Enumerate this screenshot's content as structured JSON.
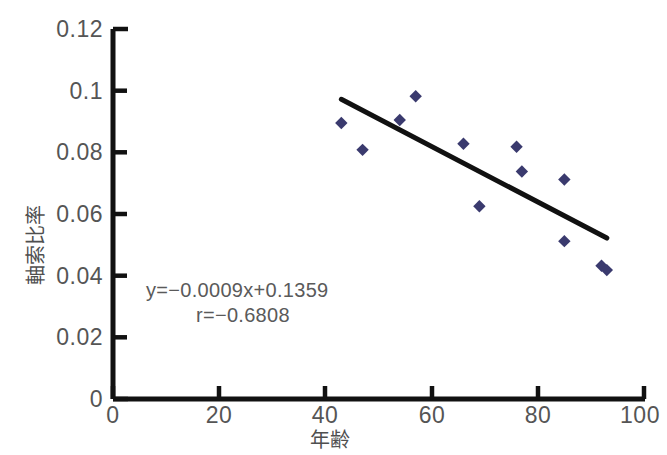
{
  "chart_data": {
    "type": "scatter",
    "title": "",
    "xlabel": "年齢",
    "ylabel": "軸索比率",
    "xlim": [
      0,
      100
    ],
    "ylim": [
      0,
      0.12
    ],
    "grid": false,
    "legend": null,
    "x_ticks": [
      "0",
      "20",
      "40",
      "60",
      "80",
      "100"
    ],
    "x_tick_values": [
      0,
      20,
      40,
      60,
      80,
      100
    ],
    "y_ticks": [
      "0",
      "0.02",
      "0.04",
      "0.06",
      "0.08",
      "0.1",
      "0.12"
    ],
    "y_tick_values": [
      0,
      0.02,
      0.04,
      0.06,
      0.08,
      0.1,
      0.12
    ],
    "marker": "diamond",
    "marker_color": "#3a3a6e",
    "points": [
      {
        "x": 43,
        "y": 0.0895
      },
      {
        "x": 47,
        "y": 0.0808
      },
      {
        "x": 54,
        "y": 0.0905
      },
      {
        "x": 57,
        "y": 0.0982
      },
      {
        "x": 66,
        "y": 0.0828
      },
      {
        "x": 69,
        "y": 0.0625
      },
      {
        "x": 76,
        "y": 0.0818
      },
      {
        "x": 77,
        "y": 0.0738
      },
      {
        "x": 85,
        "y": 0.0712
      },
      {
        "x": 85,
        "y": 0.0512
      },
      {
        "x": 92,
        "y": 0.0432
      },
      {
        "x": 93,
        "y": 0.0418
      }
    ],
    "trendline": {
      "color": "#111111",
      "x_start": 43,
      "y_start": 0.0972,
      "x_end": 93,
      "y_end": 0.0522,
      "slope": -0.0009,
      "intercept": 0.1359
    },
    "annotations": [
      {
        "text": "y=−0.0009x+0.1359",
        "x": 10,
        "y": 0.0265
      },
      {
        "text": "r=−0.6808",
        "x": 23,
        "y": 0.0205
      }
    ]
  }
}
